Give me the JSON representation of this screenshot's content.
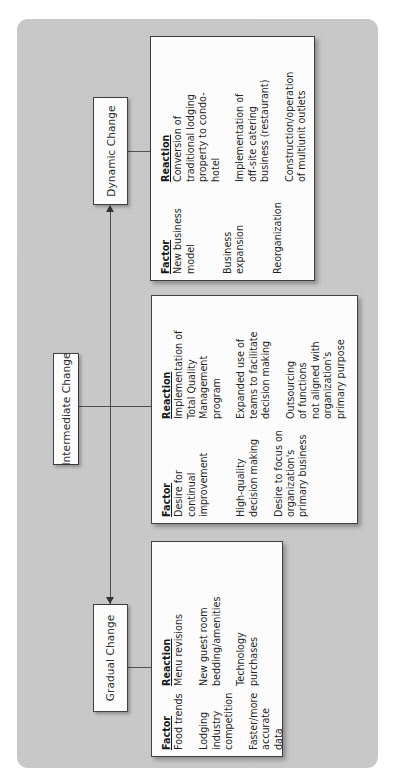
{
  "diagram": {
    "orientation": "rotated-90-ccw",
    "panel_color": "#c9c9c9",
    "box_color": "#ffffff",
    "line_color": "#4a4a4a",
    "column_headers": {
      "factor": "Factor",
      "reaction": "Reaction"
    },
    "categories": [
      {
        "label": "Dynamic Change",
        "rows": [
          {
            "factor": "New business\nmodel",
            "reaction": "Conversion of\ntraditional lodging\nproperty to condo-\nhotel"
          },
          {
            "factor": "Business expansion",
            "reaction": "Implementation of\noff-site catering\nbusiness (restaurant)"
          },
          {
            "factor": "Reorganization",
            "reaction": "Construction/operation\nof multiunit outlets"
          }
        ]
      },
      {
        "label": "Intermediate Change",
        "rows": [
          {
            "factor": "Desire for continual\nimprovement",
            "reaction": "Implementation of\nTotal Quality\nManagement\nprogram"
          },
          {
            "factor": "High-quality\ndecision making",
            "reaction": "Expanded use of\nteams to facilitate\ndecision making"
          },
          {
            "factor": "Desire to focus on\norganization's\nprimary business",
            "reaction": "Outsourcing\nof functions\nnot aligned with\norganization's\nprimary purpose"
          }
        ]
      },
      {
        "label": "Gradual Change",
        "rows": [
          {
            "factor": "Food trends",
            "reaction": "Menu revisions"
          },
          {
            "factor": "Lodging industry\ncompetition",
            "reaction": "New guest room\nbedding/amenities"
          },
          {
            "factor": "Faster/more\naccurate data\ncollection",
            "reaction": "Technology\npurchases"
          }
        ]
      }
    ]
  }
}
